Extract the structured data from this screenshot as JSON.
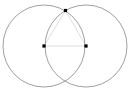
{
  "figure": {
    "background_color": "#ffffff",
    "width": 134,
    "height": 97
  },
  "style": {
    "circle_stroke_color": "#777777",
    "circle_stroke_width": 0.7,
    "chord_stroke_color": "#c8c8c8",
    "chord_stroke_width": 0.6,
    "point_fill_color": "#000000",
    "point_size": 3.2
  },
  "chart_data": {
    "type": "scatter",
    "xlabel": "",
    "ylabel": "",
    "xlim": [
      0,
      134
    ],
    "ylim": [
      0,
      97
    ],
    "grid": false,
    "legend": "none",
    "circles": [
      {
        "name": "left-circle",
        "cx": 44,
        "cy": 46,
        "r": 41
      },
      {
        "name": "right-circle",
        "cx": 86,
        "cy": 46,
        "r": 41
      }
    ],
    "points": [
      {
        "name": "left-center",
        "label": "A",
        "x": 44,
        "y": 46,
        "marker": "square",
        "shown": true
      },
      {
        "name": "right-center",
        "label": "B",
        "x": 86,
        "y": 46,
        "marker": "square",
        "shown": true
      },
      {
        "name": "top-intersection",
        "label": "C",
        "x": 65.5,
        "y": 10.5,
        "marker": "square",
        "shown": true
      },
      {
        "name": "bottom-intersection",
        "label": "D",
        "x": 65.5,
        "y": 81.5,
        "marker": "square",
        "shown": false
      }
    ],
    "segments": [
      {
        "name": "center-to-center",
        "from": "left-center",
        "to": "right-center",
        "x1": 44,
        "y1": 46,
        "x2": 86,
        "y2": 46
      },
      {
        "name": "left-center-to-top",
        "from": "left-center",
        "to": "top-intersection",
        "x1": 44,
        "y1": 46,
        "x2": 65.5,
        "y2": 10.5
      },
      {
        "name": "right-center-to-top",
        "from": "right-center",
        "to": "top-intersection",
        "x1": 86,
        "y1": 46,
        "x2": 65.5,
        "y2": 10.5
      }
    ]
  }
}
